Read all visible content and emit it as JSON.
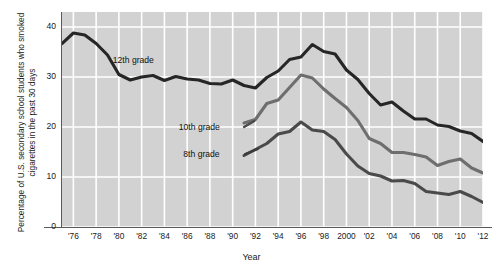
{
  "chart_data": {
    "type": "line",
    "title": "",
    "xlabel": "Year",
    "ylabel": "Percentage of U.S. secondary school students who smoked cigarettes in the past 30 days",
    "xlim": [
      1975,
      2012
    ],
    "ylim": [
      0,
      43
    ],
    "yticks": [
      0,
      10,
      20,
      30,
      40
    ],
    "ytick_labels": [
      "0",
      "10",
      "20",
      "30",
      "40"
    ],
    "xticks": [
      1976,
      1978,
      1980,
      1982,
      1984,
      1986,
      1988,
      1990,
      1992,
      1994,
      1996,
      1998,
      2000,
      2002,
      2004,
      2006,
      2008,
      2010,
      2012
    ],
    "xtick_labels": [
      "'76",
      "'78",
      "'80",
      "'82",
      "'84",
      "'86",
      "'88",
      "'90",
      "'92",
      "'94",
      "'96",
      "'98",
      "2000",
      "'02",
      "'04",
      "'06",
      "'08",
      "'10",
      "'12"
    ],
    "grid": true,
    "grid_color": "#ffffff",
    "plot_background": "#d2d2d2",
    "legend": "inline-annotations",
    "series": [
      {
        "name": "12th grade",
        "color": "#262626",
        "label_x": 1982.1,
        "label_y": 33.2,
        "x": [
          1975,
          1976,
          1977,
          1978,
          1979,
          1980,
          1981,
          1982,
          1983,
          1984,
          1985,
          1986,
          1987,
          1988,
          1989,
          1990,
          1991,
          1992,
          1993,
          1994,
          1995,
          1996,
          1997,
          1998,
          1999,
          2000,
          2001,
          2002,
          2003,
          2004,
          2005,
          2006,
          2007,
          2008,
          2009,
          2010,
          2011,
          2012
        ],
        "values": [
          36.7,
          38.8,
          38.4,
          36.7,
          34.4,
          30.5,
          29.4,
          30.0,
          30.3,
          29.3,
          30.1,
          29.6,
          29.4,
          28.7,
          28.6,
          29.4,
          28.3,
          27.8,
          29.9,
          31.2,
          33.5,
          34.0,
          36.5,
          35.1,
          34.6,
          31.4,
          29.5,
          26.7,
          24.4,
          25.0,
          23.2,
          21.6,
          21.6,
          20.4,
          20.1,
          19.2,
          18.7,
          17.1
        ]
      },
      {
        "name": "10th grade",
        "color": "#6e6e6e",
        "label_x": 1987.9,
        "label_y": 19.8,
        "x": [
          1991,
          1992,
          1993,
          1994,
          1995,
          1996,
          1997,
          1998,
          1999,
          2000,
          2001,
          2002,
          2003,
          2004,
          2005,
          2006,
          2007,
          2008,
          2009,
          2010,
          2011,
          2012
        ],
        "values": [
          20.8,
          21.5,
          24.7,
          25.4,
          27.9,
          30.4,
          29.8,
          27.6,
          25.7,
          23.9,
          21.3,
          17.7,
          16.7,
          14.9,
          14.9,
          14.5,
          14.0,
          12.3,
          13.1,
          13.6,
          11.8,
          10.8
        ]
      },
      {
        "name": "8th grade",
        "color": "#4a4a4a",
        "label_x": 1988.3,
        "label_y": 14.4,
        "x": [
          1991,
          1992,
          1993,
          1994,
          1995,
          1996,
          1997,
          1998,
          1999,
          2000,
          2001,
          2002,
          2003,
          2004,
          2005,
          2006,
          2007,
          2008,
          2009,
          2010,
          2011,
          2012
        ],
        "values": [
          14.3,
          15.5,
          16.7,
          18.6,
          19.1,
          21.0,
          19.4,
          19.1,
          17.5,
          14.6,
          12.2,
          10.7,
          10.2,
          9.2,
          9.3,
          8.7,
          7.1,
          6.8,
          6.5,
          7.1,
          6.1,
          4.9
        ]
      }
    ]
  }
}
